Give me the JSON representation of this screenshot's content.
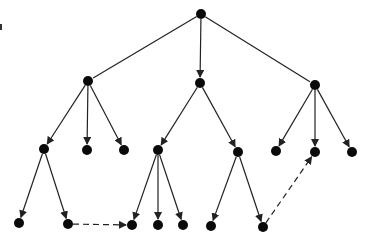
{
  "diagram": {
    "type": "tree",
    "colors": {
      "node": "#0a0a0a",
      "edge": "#222222",
      "background": "#ffffff"
    },
    "node_radius": 5,
    "nodes": [
      {
        "id": "root",
        "x": 201,
        "y": 14
      },
      {
        "id": "L",
        "x": 88,
        "y": 81
      },
      {
        "id": "C",
        "x": 200,
        "y": 83
      },
      {
        "id": "R",
        "x": 315,
        "y": 85
      },
      {
        "id": "L1",
        "x": 44,
        "y": 149
      },
      {
        "id": "L2",
        "x": 87,
        "y": 150
      },
      {
        "id": "L3",
        "x": 124,
        "y": 150
      },
      {
        "id": "C1",
        "x": 158,
        "y": 150
      },
      {
        "id": "C2",
        "x": 238,
        "y": 152
      },
      {
        "id": "R1",
        "x": 276,
        "y": 151
      },
      {
        "id": "R2",
        "x": 315,
        "y": 152
      },
      {
        "id": "R3",
        "x": 352,
        "y": 152
      },
      {
        "id": "L1a",
        "x": 19,
        "y": 223
      },
      {
        "id": "L1b",
        "x": 68,
        "y": 224
      },
      {
        "id": "C1a",
        "x": 132,
        "y": 225
      },
      {
        "id": "C1b",
        "x": 158,
        "y": 225
      },
      {
        "id": "C1c",
        "x": 183,
        "y": 225
      },
      {
        "id": "C2a",
        "x": 211,
        "y": 226
      },
      {
        "id": "C2b",
        "x": 263,
        "y": 227
      }
    ],
    "edges": [
      {
        "from": "root",
        "to": "L",
        "style": "solid",
        "arrow": false
      },
      {
        "from": "root",
        "to": "C",
        "style": "solid",
        "arrow": true
      },
      {
        "from": "root",
        "to": "R",
        "style": "solid",
        "arrow": false
      },
      {
        "from": "L",
        "to": "L1",
        "style": "solid",
        "arrow": true
      },
      {
        "from": "L",
        "to": "L2",
        "style": "solid",
        "arrow": true
      },
      {
        "from": "L",
        "to": "L3",
        "style": "solid",
        "arrow": true
      },
      {
        "from": "C",
        "to": "C1",
        "style": "solid",
        "arrow": true
      },
      {
        "from": "C",
        "to": "C2",
        "style": "solid",
        "arrow": true
      },
      {
        "from": "R",
        "to": "R1",
        "style": "solid",
        "arrow": true
      },
      {
        "from": "R",
        "to": "R2",
        "style": "solid",
        "arrow": true
      },
      {
        "from": "R",
        "to": "R3",
        "style": "solid",
        "arrow": true
      },
      {
        "from": "L1",
        "to": "L1a",
        "style": "solid",
        "arrow": true
      },
      {
        "from": "L1",
        "to": "L1b",
        "style": "solid",
        "arrow": true
      },
      {
        "from": "C1",
        "to": "C1a",
        "style": "solid",
        "arrow": true
      },
      {
        "from": "C1",
        "to": "C1b",
        "style": "solid",
        "arrow": true
      },
      {
        "from": "C1",
        "to": "C1c",
        "style": "solid",
        "arrow": true
      },
      {
        "from": "C2",
        "to": "C2a",
        "style": "solid",
        "arrow": true
      },
      {
        "from": "C2",
        "to": "C2b",
        "style": "solid",
        "arrow": true
      },
      {
        "from": "L1b",
        "to": "C1a",
        "style": "dashed",
        "arrow": true
      },
      {
        "from": "C2b",
        "to": "R2",
        "style": "dashed",
        "arrow": true
      }
    ]
  }
}
